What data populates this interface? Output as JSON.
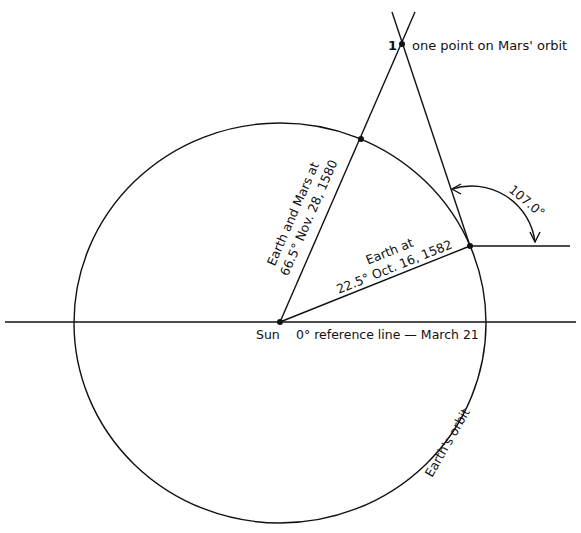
{
  "diagram": {
    "colors": {
      "ink": "#111111",
      "background": "#ffffff"
    },
    "labels": {
      "mars_point_number": "1",
      "mars_point": "one point on Mars' orbit",
      "earth_mars_1580_line1": "Earth and Mars at",
      "earth_mars_1580_line2": "66.5° Nov. 28, 1580",
      "earth_1582_line1": "Earth at",
      "earth_1582_line2": "22.5° Oct. 16, 1582",
      "angle": "107.0°",
      "sun": "Sun",
      "reference_line": "0° reference line — March 21",
      "earth_orbit": "Earth's orbit"
    },
    "nodes": [
      {
        "id": "sun",
        "label": "Sun"
      },
      {
        "id": "earth_1580",
        "label": "Earth at 66.5° Nov. 28, 1580"
      },
      {
        "id": "earth_1582",
        "label": "Earth at 22.5° Oct. 16, 1582"
      },
      {
        "id": "mars_point_1",
        "label": "one point on Mars' orbit"
      }
    ],
    "edges": [
      {
        "from": "sun",
        "to": "earth_1580",
        "note": "extends to Mars point"
      },
      {
        "from": "sun",
        "to": "earth_1582"
      },
      {
        "from": "earth_1582",
        "to": "mars_point_1",
        "note": "sight line at 107.0°"
      }
    ]
  }
}
